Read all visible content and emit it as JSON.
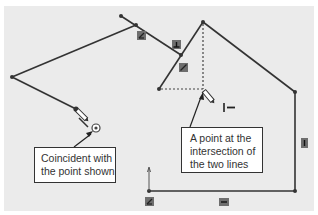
{
  "diagram": {
    "colors": {
      "canvas": "#ebebeb",
      "line": "#333333",
      "relation_icon": "#6e6e6e"
    },
    "callouts": [
      {
        "id": "coincident",
        "lines": [
          "Coincident with",
          "the point shown"
        ]
      },
      {
        "id": "intersection",
        "lines": [
          "A point at the",
          "intersection of",
          "the two lines"
        ]
      }
    ],
    "relation_icons": [
      {
        "name": "angle-relation-icon"
      },
      {
        "name": "perpendicular-relation-icon"
      },
      {
        "name": "parallel-relation-icon"
      },
      {
        "name": "vertical-relation-icon"
      },
      {
        "name": "horizontal-relation-icon"
      },
      {
        "name": "fixed-relation-icon"
      },
      {
        "name": "coincident-relation-icon"
      },
      {
        "name": "intersection-relation-icon"
      }
    ],
    "cursor_label": "I —"
  }
}
